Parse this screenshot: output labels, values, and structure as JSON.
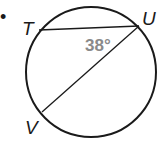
{
  "diagram": {
    "type": "circle-geometry",
    "points": [
      {
        "id": "T",
        "label": "T",
        "x": 39,
        "y": 30
      },
      {
        "id": "U",
        "label": "U",
        "x": 139,
        "y": 26
      },
      {
        "id": "V",
        "label": "V",
        "x": 42,
        "y": 112
      }
    ],
    "segments": [
      {
        "from": "T",
        "to": "U"
      },
      {
        "from": "U",
        "to": "V"
      }
    ],
    "circle": {
      "cx": 91,
      "cy": 72,
      "r": 65
    },
    "angle": {
      "vertex": "U",
      "label": "38°",
      "color": "#8a8a8a"
    },
    "bullet": "•"
  }
}
